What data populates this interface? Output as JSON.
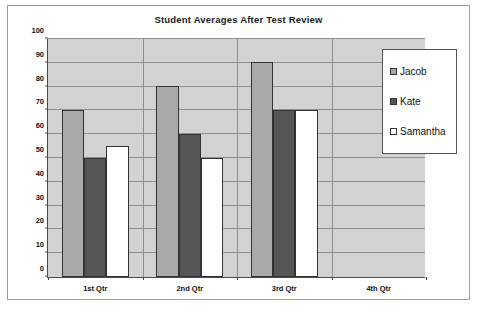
{
  "chart_data": {
    "type": "bar",
    "title": "Student Averages After Test Review",
    "xlabel": "",
    "ylabel": "",
    "categories": [
      "1st Qtr",
      "2nd Qtr",
      "3rd Qtr",
      "4th Qtr"
    ],
    "series": [
      {
        "name": "Jacob",
        "values": [
          70,
          80,
          90,
          0
        ],
        "color": "#a9a9a9"
      },
      {
        "name": "Kate",
        "values": [
          50,
          60,
          70,
          0
        ],
        "color": "#565656"
      },
      {
        "name": "Samantha",
        "values": [
          55,
          50,
          70,
          0
        ],
        "color": "#ffffff"
      }
    ],
    "ylim": [
      0,
      100
    ],
    "ytick_step": 10,
    "yticks": [
      0,
      10,
      20,
      30,
      40,
      50,
      60,
      70,
      80,
      90,
      100
    ],
    "ytick_labels": [
      "0",
      "10",
      "20",
      "30",
      "40",
      "50",
      "60",
      "70",
      "80",
      "90",
      "100"
    ],
    "grid": true,
    "grid_axis": "y",
    "legend_position": "inside-top-right",
    "plot_background": "#d2d2d2",
    "gridline_color": "#8f8f8f",
    "axis_color": "#4a4a4a",
    "frame_border_color": "#9a9a9a"
  },
  "legend": {
    "entries": [
      {
        "label": "Jacob",
        "swatch": "#a9a9a9"
      },
      {
        "label": "Kate",
        "swatch": "#565656"
      },
      {
        "label": "Samantha",
        "swatch": "#ffffff"
      }
    ]
  }
}
